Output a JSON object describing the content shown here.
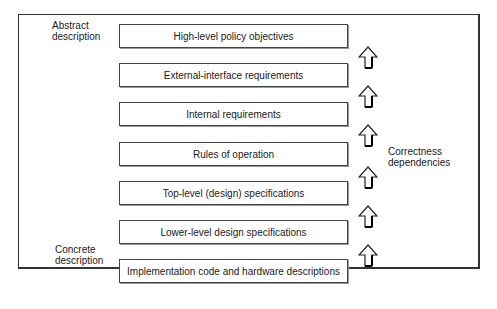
{
  "diagram": {
    "levels": [
      {
        "label": "High-level policy objectives"
      },
      {
        "label": "External-interface requirements"
      },
      {
        "label": "Internal requirements"
      },
      {
        "label": "Rules of operation"
      },
      {
        "label": "Top-level (design) specifications"
      },
      {
        "label": "Lower-level design specifications"
      },
      {
        "label": "Implementation code and hardware descriptions"
      }
    ],
    "side_labels": {
      "top": {
        "line1": "Abstract",
        "line2": "description"
      },
      "bottom": {
        "line1": "Concrete",
        "line2": "description"
      }
    },
    "dependency_label": {
      "line1": "Correctness",
      "line2": "dependencies"
    },
    "arrow_icon": "hollow-up-arrow-icon",
    "arrow_count": 6
  }
}
